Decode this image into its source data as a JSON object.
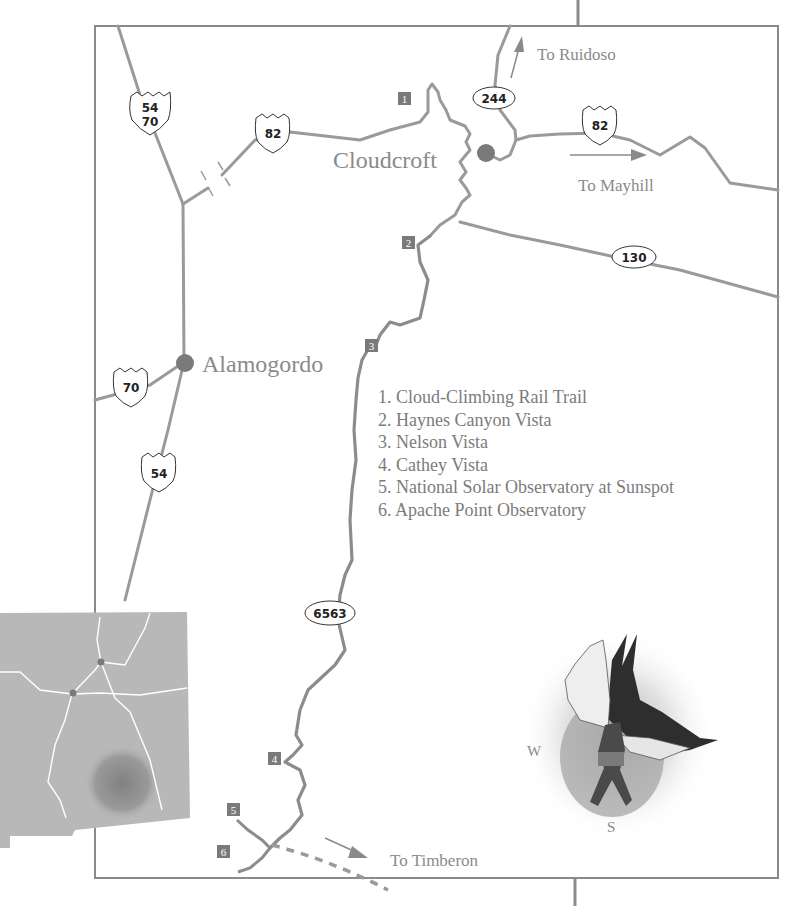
{
  "map": {
    "colors": {
      "road": "#9a9a9a",
      "route_6563": "#8c8c8c",
      "frame": "#8a8a8a",
      "city_dot": "#7a7a7a",
      "marker_bg": "#7a7a7a",
      "label_text": "#8a8a8a",
      "inset_fill": "#b8b8b8",
      "inset_roads": "#ffffff"
    },
    "cities": [
      {
        "name": "Cloudcroft"
      },
      {
        "name": "Alamogordo"
      }
    ],
    "directions": [
      {
        "label": "To Ruidoso"
      },
      {
        "label": "To Mayhill"
      },
      {
        "label": "To Timberon"
      }
    ],
    "route_shields": {
      "us_54_70": {
        "line1": "54",
        "line2": "70"
      },
      "us_82_west": "82",
      "us_82_east": "82",
      "us_70": "70",
      "us_54": "54"
    },
    "state_routes": {
      "nm_244": "244",
      "nm_130": "130",
      "nm_6563": "6563"
    },
    "markers": [
      "1",
      "2",
      "3",
      "4",
      "5",
      "6"
    ],
    "legend": [
      "1. Cloud-Climbing Rail Trail",
      "2. Haynes Canyon Vista",
      "3. Nelson Vista",
      "4. Cathey Vista",
      "5. National Solar Observatory at Sunspot",
      "6. Apache Point Observatory"
    ],
    "compass": {
      "west": "W",
      "south": "S"
    },
    "inset": {
      "description": "New Mexico locator map"
    }
  }
}
